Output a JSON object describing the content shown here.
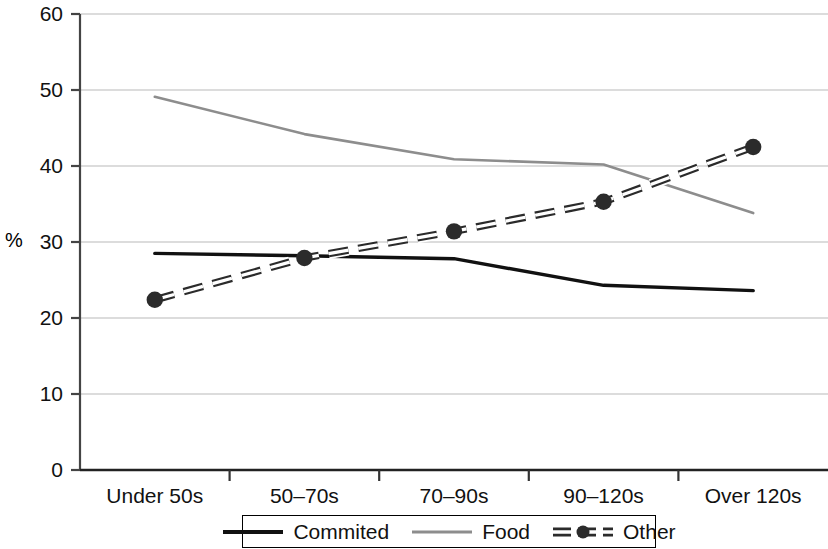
{
  "chart_data": {
    "type": "line",
    "title": "",
    "xlabel": "",
    "ylabel": "%",
    "categories": [
      "Under 50s",
      "50–70s",
      "70–90s",
      "90–120s",
      "Over 120s"
    ],
    "ylim": [
      0,
      60
    ],
    "yticks": [
      0,
      10,
      20,
      30,
      40,
      50,
      60
    ],
    "ytick_labels": [
      "0",
      "10",
      "20",
      "30",
      "40",
      "50",
      "60"
    ],
    "grid": true,
    "grid_axis": "y",
    "legend_position": "bottom",
    "series": [
      {
        "name": "Commited",
        "values": [
          28.5,
          28.2,
          27.8,
          24.3,
          23.6
        ],
        "color": "#111111",
        "style": "solid",
        "markers": false
      },
      {
        "name": "Food",
        "values": [
          49.1,
          44.2,
          40.9,
          40.2,
          33.8
        ],
        "color": "#8d8d8d",
        "style": "solid",
        "markers": false
      },
      {
        "name": "Other",
        "values": [
          22.4,
          27.9,
          31.4,
          35.3,
          42.5
        ],
        "color": "#2b2b2b",
        "style": "dashed",
        "markers": true
      }
    ]
  },
  "axes": {
    "y_axis_label": "%",
    "axis_color": "#444444",
    "grid_color": "#b9b9b9"
  },
  "legend": {
    "entries": [
      {
        "label": "Commited",
        "swatch": "solid-black-line"
      },
      {
        "label": "Food",
        "swatch": "solid-gray-line"
      },
      {
        "label": "Other",
        "swatch": "dashed-line-with-marker"
      }
    ]
  }
}
